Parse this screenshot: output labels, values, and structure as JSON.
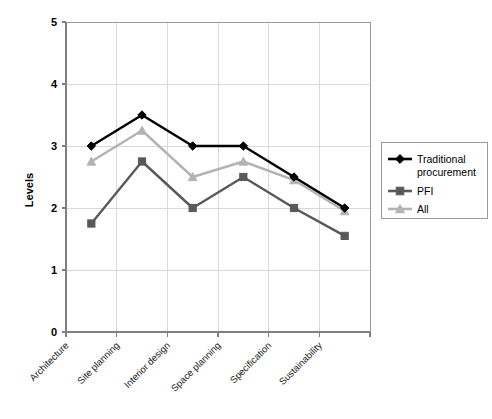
{
  "chart_data": {
    "type": "line",
    "title": "",
    "xlabel": "",
    "ylabel": "Levels",
    "ylim": [
      0,
      5
    ],
    "yticks": [
      0,
      1,
      2,
      3,
      4,
      5
    ],
    "ytick_labels": [
      "0",
      "1",
      "2",
      "3",
      "4",
      "5"
    ],
    "grid": true,
    "legend_position": "right",
    "categories": [
      "Architecture",
      "Site planning",
      "Interior design",
      "Space planning",
      "Specification",
      "Sustainability"
    ],
    "series": [
      {
        "name": "Traditional procurement",
        "marker": "diamond",
        "color": "#000000",
        "values": [
          3.0,
          3.5,
          3.0,
          3.0,
          2.5,
          2.0
        ]
      },
      {
        "name": "PFI",
        "marker": "square",
        "color": "#595959",
        "values": [
          1.75,
          2.75,
          2.0,
          2.5,
          2.0,
          1.55
        ]
      },
      {
        "name": "All",
        "marker": "triangle",
        "color": "#b3b3b3",
        "values": [
          2.75,
          3.25,
          2.5,
          2.75,
          2.45,
          1.95
        ]
      }
    ]
  },
  "axes": {
    "y_title": "Levels"
  },
  "legend": {
    "entries": [
      {
        "label": "Traditional procurement",
        "label_line1": "Traditional",
        "label_line2": "procurement"
      },
      {
        "label": "PFI",
        "label_line1": "PFI",
        "label_line2": ""
      },
      {
        "label": "All",
        "label_line1": "All",
        "label_line2": ""
      }
    ]
  },
  "colors": {
    "series_traditional": "#000000",
    "series_pfi": "#595959",
    "series_all": "#b3b3b3",
    "gridline": "#d9d9d9",
    "axis": "#808080",
    "background": "#ffffff"
  }
}
